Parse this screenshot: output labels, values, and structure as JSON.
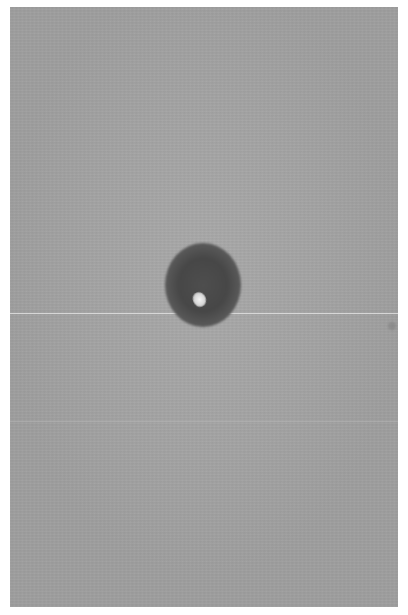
{
  "image": {
    "description": "Grayscale photograph of a dark round spot with a bright highlight on a uniform gray surface",
    "background_color": "#a5a5a5",
    "spot_color": "#4a4a4a",
    "highlight_color": "#f0f0f0",
    "page_background": "#ffffff"
  },
  "caption": {
    "text": ""
  }
}
